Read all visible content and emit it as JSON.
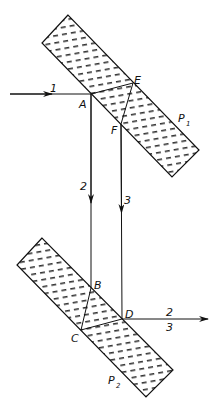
{
  "diagram": {
    "colors": {
      "line": "#111111",
      "background": "#ffffff",
      "hatch": "#333333"
    },
    "plates": [
      {
        "id": "P1",
        "label": "P",
        "subscript": "1",
        "corners": [
          [
            68,
            15
          ],
          [
            42,
            43
          ],
          [
            172,
            177
          ],
          [
            199,
            150
          ]
        ]
      },
      {
        "id": "P2",
        "label": "P",
        "subscript": "2",
        "corners": [
          [
            42,
            238
          ],
          [
            17,
            265
          ],
          [
            146,
            397
          ],
          [
            173,
            370
          ]
        ]
      }
    ],
    "points": {
      "A": {
        "label": "A",
        "x": 91,
        "y": 94
      },
      "E": {
        "label": "E",
        "x": 133,
        "y": 83
      },
      "F": {
        "label": "F",
        "x": 121,
        "y": 124
      },
      "B": {
        "label": "B",
        "x": 91,
        "y": 288
      },
      "C": {
        "label": "C",
        "x": 81,
        "y": 330
      },
      "D": {
        "label": "D",
        "x": 122,
        "y": 319
      }
    },
    "rays": {
      "ray1": {
        "label": "1"
      },
      "ray2": {
        "label": "2"
      },
      "ray3": {
        "label": "3"
      },
      "out_top": {
        "label": "2"
      },
      "out_bottom": {
        "label": "3"
      }
    }
  }
}
